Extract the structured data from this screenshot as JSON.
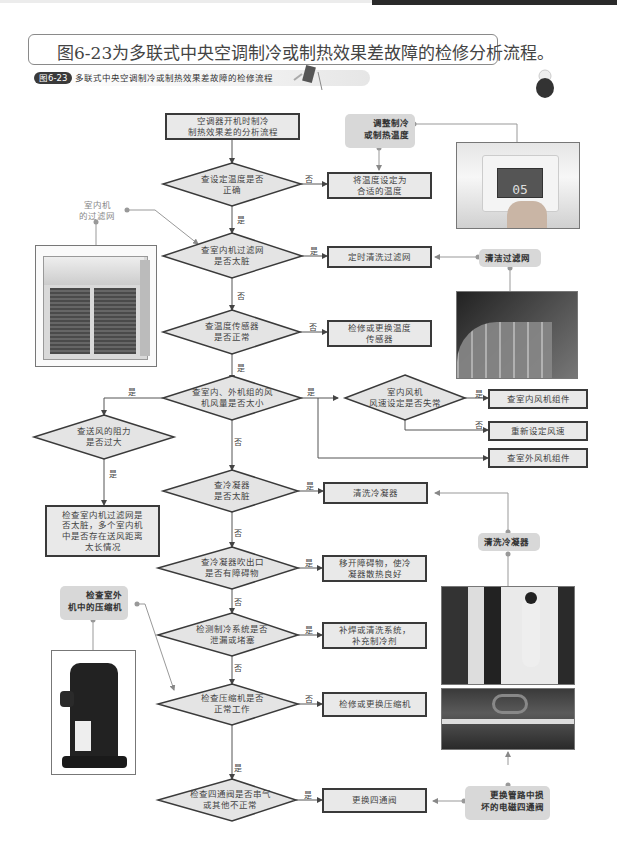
{
  "page": {
    "heading": "图6-23为多联式中央空调制冷或制热效果差故障的检修分析流程。",
    "figure_badge": "图6-23",
    "figure_title": "多联式中央空调制冷或制热效果差故障的检修流程"
  },
  "flow": {
    "start": "空调器开机时制冷\n制热效果差的分析流程",
    "d1": "查设定温度是否\n正确",
    "a1": "将温度设定为\n合适的温度",
    "d2": "查室内机过滤网\n是否太脏",
    "a2": "定时清洗过滤网",
    "d3": "查温度传感器\n是否正常",
    "a3": "检修或更换温度\n传感器",
    "d4": "查室内、外机组的风\n机风量是否太小",
    "d5": "室内风机\n风速设定是否失常",
    "a5_yes": "查室内风机组件",
    "a5_no": "重新设定风速",
    "a4_outdoor": "查室外风机组件",
    "d6": "查送风的阻力\n是否过大",
    "a6": "检查室内机过滤网是\n否太脏，多个室内机\n中是否存在送风距离\n太长情况",
    "d7": "查冷凝器\n是否太脏",
    "a7": "清洗冷凝器",
    "d8": "查冷凝器吹出口\n是否有障碍物",
    "a8": "移开障碍物，使冷\n凝器散热良好",
    "d9": "检测制冷系统是否\n泄漏或堵塞",
    "a9": "补焊或清洗系统，\n补充制冷剂",
    "d10": "检查压缩机是否\n正常工作",
    "a10": "检修或更换压缩机",
    "d11": "检查四通阀是否串气\n或其他不正常",
    "a11": "更换四通阀"
  },
  "labels": {
    "yes": "是",
    "no": "否"
  },
  "callouts": {
    "adjust_temp": "调整制冷\n或制热温度",
    "indoor_filter": "室内机\n的过滤网",
    "clean_filter": "清洁过滤网",
    "clean_condenser": "清洗冷凝器",
    "check_compressor": "检查室外\n机中的压缩机",
    "replace_valve": "更换管路中损\n坏的电磁四通阀"
  },
  "photos": {
    "thermostat_display": "05"
  },
  "colors": {
    "box_fill": "#e9e9e9",
    "box_border": "#3a3a3a",
    "callout_fill": "#d8d8d8",
    "line": "#555555"
  }
}
